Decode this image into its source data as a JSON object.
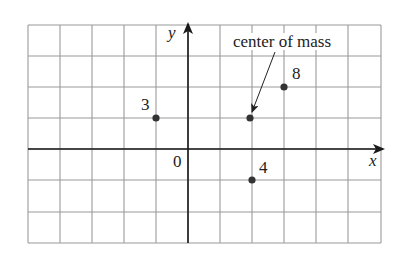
{
  "figure": {
    "width": 403,
    "height": 260,
    "colors": {
      "grid": "#9a9a9a",
      "axis": "#1a1a1a",
      "point": "#333333",
      "text": "#222222",
      "background": "#ffffff"
    },
    "grid": {
      "x_lines": [
        28,
        60,
        92,
        124,
        156,
        188,
        220,
        252,
        284,
        316,
        348,
        381
      ],
      "y_lines": [
        25,
        56,
        87,
        118,
        149,
        180,
        212,
        243
      ],
      "origin_px": [
        188,
        149
      ],
      "unit_px": [
        32,
        31
      ]
    },
    "axes": {
      "x_label": "x",
      "y_label": "y",
      "origin_label": "0"
    },
    "points": [
      {
        "label": "3",
        "x": -1,
        "y": 1,
        "px": [
          156,
          118
        ],
        "label_px": [
          141,
          110
        ]
      },
      {
        "label": "8",
        "x": 3,
        "y": 2,
        "px": [
          284,
          87
        ],
        "label_px": [
          292,
          79
        ]
      },
      {
        "label": "4",
        "x": 2,
        "y": -1,
        "px": [
          252,
          180
        ],
        "label_px": [
          259,
          173
        ]
      }
    ],
    "center_of_mass": {
      "label": "center of mass",
      "x": 1.93,
      "y": 1,
      "px": [
        250,
        118
      ],
      "label_px": [
        282,
        47
      ],
      "arrow_from_px": [
        275,
        52
      ],
      "arrow_to_px": [
        252,
        112
      ]
    }
  },
  "chart_data": {
    "type": "scatter",
    "title": "",
    "xlabel": "x",
    "ylabel": "y",
    "xlim": [
      -5,
      6
    ],
    "ylim": [
      -3,
      4
    ],
    "grid": true,
    "points": [
      {
        "x": -1,
        "y": 1,
        "mass": 3
      },
      {
        "x": 3,
        "y": 2,
        "mass": 8
      },
      {
        "x": 2,
        "y": -1,
        "mass": 4
      }
    ],
    "annotations": [
      {
        "text": "center of mass",
        "x": 1.93,
        "y": 1
      },
      {
        "text": "0",
        "x": 0,
        "y": 0
      }
    ]
  }
}
